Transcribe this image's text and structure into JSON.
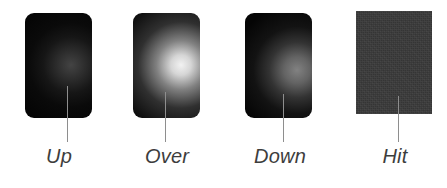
{
  "figure": {
    "name": "button-states-diagram",
    "background_color": "#ffffff",
    "width": 447,
    "height": 188,
    "label_color": "#3d3d3d",
    "leader_color": "#8e8e8e"
  },
  "states": [
    {
      "key": "up",
      "label": "Up",
      "shape": "rounded-rectangle",
      "plate_color": "#050505",
      "glow_center_color": "#6a6a6a",
      "glow_description": "dim soft radial glow",
      "swatch": {
        "x": 25,
        "y": 13,
        "width": 67,
        "height": 105
      },
      "glow": {
        "cx": 46,
        "cy": 52,
        "radius": 62,
        "intensity": "dim"
      },
      "leader": {
        "x": 67,
        "y": 86,
        "height": 56
      },
      "label_box": {
        "x": 24,
        "y": 145,
        "width": 70
      }
    },
    {
      "key": "over",
      "label": "Over",
      "shape": "rounded-rectangle",
      "plate_color": "#050505",
      "glow_center_color": "#f2f2f2",
      "glow_description": "bright large radial glow",
      "swatch": {
        "x": 133,
        "y": 13,
        "width": 67,
        "height": 105
      },
      "glow": {
        "cx": 48,
        "cy": 52,
        "radius": 72,
        "intensity": "bright"
      },
      "leader": {
        "x": 165,
        "y": 92,
        "height": 50
      },
      "label_box": {
        "x": 130,
        "y": 145,
        "width": 74
      }
    },
    {
      "key": "down",
      "label": "Down",
      "shape": "rounded-rectangle",
      "plate_color": "#050505",
      "glow_center_color": "#9d9d9d",
      "glow_description": "medium radial glow shifted low-right",
      "swatch": {
        "x": 245,
        "y": 13,
        "width": 67,
        "height": 105
      },
      "glow": {
        "cx": 52,
        "cy": 57,
        "radius": 66,
        "intensity": "medium"
      },
      "leader": {
        "x": 283,
        "y": 94,
        "height": 48
      },
      "label_box": {
        "x": 239,
        "y": 145,
        "width": 82
      }
    },
    {
      "key": "hit",
      "label": "Hit",
      "shape": "rectangle",
      "plate_color": "#3a3a3a",
      "glow_center_color": null,
      "glow_description": "flat grainy fill, no glow",
      "swatch": {
        "x": 356,
        "y": 11,
        "width": 76,
        "height": 103
      },
      "glow": null,
      "leader": {
        "x": 398,
        "y": 96,
        "height": 46
      },
      "label_box": {
        "x": 360,
        "y": 145,
        "width": 70
      }
    }
  ]
}
